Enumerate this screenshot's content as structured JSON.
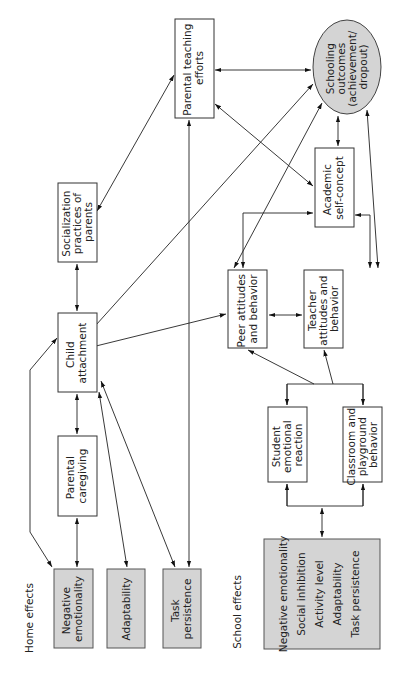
{
  "diagram": {
    "sections": {
      "home": "Home effects",
      "school": "School effects"
    },
    "nodes": {
      "parental_teaching": [
        "Parental teaching",
        "efforts"
      ],
      "schooling_outcomes": [
        "Schooling",
        "outcomes",
        "(achievement/",
        "dropout)"
      ],
      "socialization": [
        "Socialization",
        "practices of",
        "parents"
      ],
      "academic": [
        "Academic",
        "self-concept"
      ],
      "child_attachment": [
        "Child",
        "attachment"
      ],
      "peer": [
        "Peer attitudes",
        "and behavior"
      ],
      "teacher": [
        "Teacher",
        "attitudes and",
        "behavior"
      ],
      "parental_caregiving": [
        "Parental",
        "caregiving"
      ],
      "student_emotional": [
        "Student",
        "emotional",
        "reaction"
      ],
      "classroom": [
        "Classroom and",
        "playground",
        "behavior"
      ],
      "negative_emotionality": [
        "Negative",
        "emotionality"
      ],
      "adaptability": [
        "Adaptability"
      ],
      "task_persistence": [
        "Task",
        "persistence"
      ],
      "school_traits": [
        "Negative emotionality",
        "Social inhibition",
        "Activity level",
        "Adaptability",
        "Task persistence"
      ]
    },
    "colors": {
      "shaded_fill": "#d4d4d4",
      "line": "#222222"
    }
  }
}
